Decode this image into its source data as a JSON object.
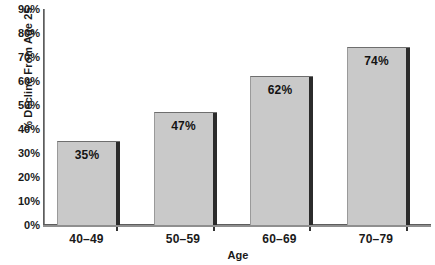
{
  "chart_data": {
    "type": "bar",
    "title": "",
    "subtitle": "",
    "xlabel": "Age",
    "ylabel": "% Decline From Age 25",
    "categories": [
      "40–49",
      "50–59",
      "60–69",
      "70–79"
    ],
    "values": [
      35,
      47,
      62,
      74
    ],
    "data_labels": [
      "35%",
      "47%",
      "62%",
      "74%"
    ],
    "ylim": [
      0,
      90
    ],
    "ytick_values": [
      0,
      10,
      20,
      30,
      40,
      50,
      60,
      70,
      80,
      90
    ],
    "ytick_labels": [
      "0%",
      "10%",
      "20%",
      "30%",
      "40%",
      "50%",
      "60%",
      "70%",
      "80%",
      "90%"
    ],
    "grid": false,
    "legend": false,
    "legend_position": "none",
    "series": [
      {
        "name": "% Decline From Age 25",
        "values": [
          35,
          47,
          62,
          74
        ]
      }
    ],
    "colors": {
      "bar_fill": "#c9c9c9",
      "bar_edge": "#6e6e6e",
      "bar_shadow": "#2b2b2b",
      "axis": "#5d5d5d",
      "text": "#1a1a1a",
      "background": "#ffffff"
    }
  }
}
